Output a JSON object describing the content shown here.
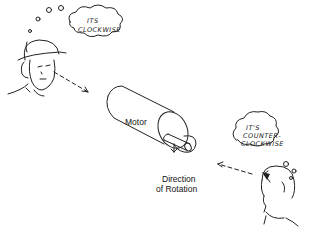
{
  "diagram": {
    "motor_label": "Motor",
    "rotation_label_line1": "Direction",
    "rotation_label_line2": "of Rotation",
    "observer_left": {
      "thought_line1": "ITS",
      "thought_line2": "CLOCKWISE"
    },
    "observer_right": {
      "thought_line1": "IT'S",
      "thought_line2": "COUNTER-",
      "thought_line3": "CLOCKWISE"
    }
  }
}
